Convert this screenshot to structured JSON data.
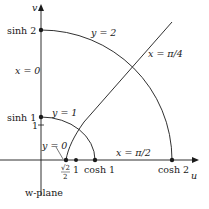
{
  "diagram": {
    "plane_label": "w-plane",
    "axes": {
      "u": "u",
      "v": "v"
    },
    "v_axis_labels": {
      "sinh2": "sinh 2",
      "sinh1": "sinh 1",
      "one": "1"
    },
    "u_axis_labels": {
      "sqrt2_num": "√2",
      "sqrt2_den": "2",
      "one": "1",
      "cosh1": "cosh 1",
      "cosh2": "cosh 2"
    },
    "curve_labels": {
      "y2": "y = 2",
      "y1": "y = 1",
      "y0": "y = 0",
      "x0": "x = 0",
      "x_pi4": "x = π/4",
      "x_pi2": "x = π/2"
    },
    "stroke_color": "#1a1a1a"
  }
}
